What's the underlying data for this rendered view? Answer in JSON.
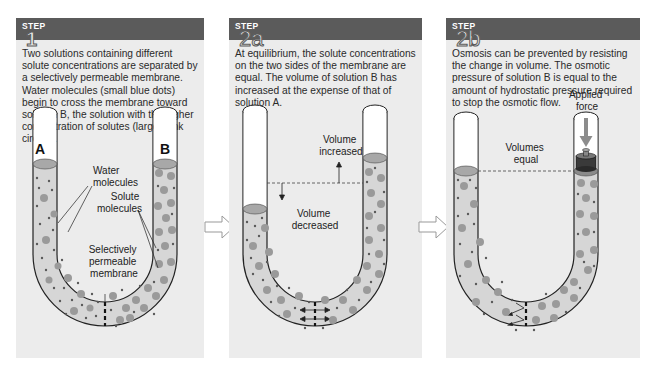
{
  "colors": {
    "header_bg": "#5b5b5b",
    "panel_bg": "#ececec",
    "solution_fill": "#d6d6d6",
    "surface_fill": "#a8a8a8",
    "water_dot": "#5a5a5a",
    "solute_circle": "#9a9a9a"
  },
  "panels": [
    {
      "step_label": "STEP",
      "step_number": "1",
      "description": "Two solutions containing different solute concentrations are separated by a selectively permeable membrane. Water molecules (small blue dots) begin to cross the membrane toward solution B, the solution with the higher concentration of solutes (larger pink circles).",
      "labels": {
        "tube_a": "A",
        "tube_b": "B",
        "water_line1": "Water",
        "water_line2": "molecules",
        "solute_line1": "Solute",
        "solute_line2": "molecules",
        "membrane_line1": "Selectively",
        "membrane_line2": "permeable",
        "membrane_line3": "membrane"
      }
    },
    {
      "step_label": "STEP",
      "step_number": "2a",
      "description": "At equilibrium, the solute concentrations on the two sides of the membrane are equal. The volume of solution B has increased at the expense of that of solution A.",
      "labels": {
        "increased_line1": "Volume",
        "increased_line2": "increased",
        "decreased_line1": "Volume",
        "decreased_line2": "decreased"
      }
    },
    {
      "step_label": "STEP",
      "step_number": "2b",
      "description": "Osmosis can be prevented by resisting the change in volume. The osmotic pressure of solution B is equal to the amount of hydrostatic pressure required to stop the osmotic flow.",
      "labels": {
        "force_line1": "Applied",
        "force_line2": "force",
        "equal_line1": "Volumes",
        "equal_line2": "equal"
      }
    }
  ],
  "connectors": [
    {
      "icon": "right-arrow-icon"
    },
    {
      "icon": "right-arrow-icon"
    }
  ]
}
